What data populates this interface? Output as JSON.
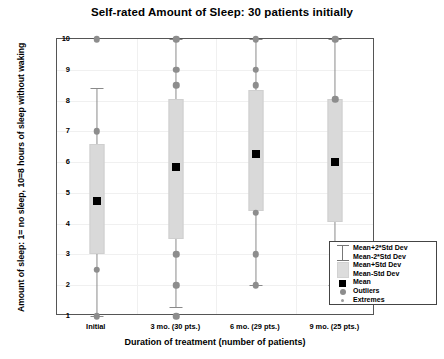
{
  "chart_data": {
    "type": "box",
    "title": "Self-rated Amount of Sleep:  30 patients initially",
    "xlabel": "Duration of treatment (number of patients)",
    "ylabel": "Amount of sleep: 1= no sleep, 10=8 hours of sleep without waking",
    "categories": [
      "Initial",
      "3 mo. (30 pts.)",
      "6 mo. (29 pts.)",
      "9 mo. (25 pts.)"
    ],
    "ylim": [
      1,
      10
    ],
    "yticks": [
      1,
      2,
      3,
      4,
      5,
      6,
      7,
      8,
      9,
      10
    ],
    "grid": true,
    "legend_position": "bottom-right",
    "series": [
      {
        "name": "Initial",
        "mean": 4.75,
        "box_top": 6.6,
        "box_bottom": 3.0,
        "whisker_top": 8.4,
        "whisker_bottom": 1.0,
        "outliers": [
          10.0,
          7.0,
          2.5,
          1.0
        ],
        "extremes": []
      },
      {
        "name": "3 mo. (30 pts.)",
        "mean": 5.85,
        "box_top": 8.05,
        "box_bottom": 3.5,
        "whisker_top": 10.0,
        "whisker_bottom": 1.3,
        "outliers": [
          10.0,
          9.0,
          8.5,
          3.0,
          2.0,
          1.0
        ],
        "extremes": []
      },
      {
        "name": "6 mo. (29 pts.)",
        "mean": 6.25,
        "box_top": 8.35,
        "box_bottom": 4.4,
        "whisker_top": 10.0,
        "whisker_bottom": 2.0,
        "outliers": [
          10.0,
          9.0,
          8.5,
          4.35,
          3.0,
          2.0
        ],
        "extremes": []
      },
      {
        "name": "9 mo. (25 pts.)",
        "mean": 6.0,
        "box_top": 8.05,
        "box_bottom": 4.05,
        "whisker_top": 10.0,
        "whisker_bottom": 2.0,
        "outliers": [
          10.0,
          8.05,
          3.0,
          2.0
        ],
        "extremes": []
      }
    ],
    "legend": [
      {
        "label": "Mean+2*Std Dev",
        "key": "whisker-top"
      },
      {
        "label": "Mean-2*Std Dev",
        "key": "whisker-bottom"
      },
      {
        "label": "Mean+Std Dev",
        "key": "box-top"
      },
      {
        "label": "Mean-Std Dev",
        "key": "box-bottom"
      },
      {
        "label": "Mean",
        "key": "mean-square"
      },
      {
        "label": "Outliers",
        "key": "outlier-circle"
      },
      {
        "label": "Extremes",
        "key": "extreme-dot"
      }
    ],
    "colors": {
      "box_fill": "#d9d9d9",
      "mean": "#000000",
      "outlier": "#8d8d8d",
      "whisker": "#8a8a8a",
      "frame": "#555555",
      "grid": "#f0f0f0"
    }
  }
}
